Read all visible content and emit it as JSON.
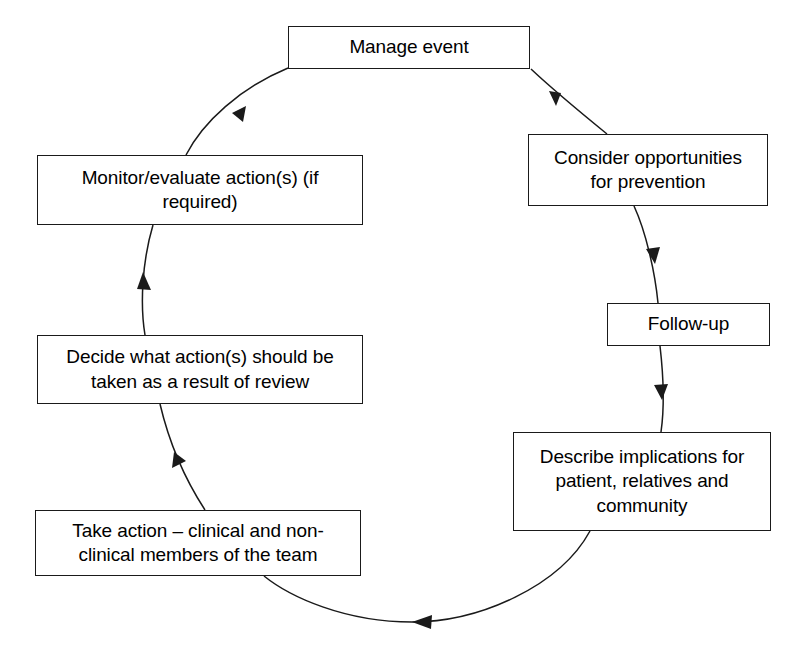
{
  "diagram": {
    "type": "cycle-flow",
    "direction": "counter-clockwise",
    "stroke_color": "#1a1a1a",
    "background_color": "#ffffff",
    "nodes": [
      {
        "id": "manage-event",
        "label": "Manage event"
      },
      {
        "id": "consider",
        "label": "Consider opportunities\nfor prevention"
      },
      {
        "id": "follow-up",
        "label": "Follow-up"
      },
      {
        "id": "describe",
        "label": "Describe implications for\npatient, relatives and\ncommunity"
      },
      {
        "id": "take-action",
        "label": "Take action – clinical and non-\nclinical members of the team"
      },
      {
        "id": "decide",
        "label": "Decide what action(s) should be\ntaken as a result of review"
      },
      {
        "id": "monitor",
        "label": "Monitor/evaluate action(s) (if\nrequired)"
      }
    ],
    "connectors": [
      {
        "id": "manage-to-consider",
        "from": "manage-event",
        "to": "consider",
        "arrow": "down-right"
      },
      {
        "id": "consider-to-followup",
        "from": "consider",
        "to": "follow-up",
        "arrow": "down"
      },
      {
        "id": "followup-to-describe",
        "from": "follow-up",
        "to": "describe",
        "arrow": "down"
      },
      {
        "id": "describe-to-takeaction",
        "from": "describe",
        "to": "take-action",
        "arrow": "left"
      },
      {
        "id": "takeaction-to-decide",
        "from": "take-action",
        "to": "decide",
        "arrow": "up-left"
      },
      {
        "id": "decide-to-monitor",
        "from": "decide",
        "to": "monitor",
        "arrow": "up"
      },
      {
        "id": "monitor-to-manage",
        "from": "monitor",
        "to": "manage-event",
        "arrow": "up-right"
      }
    ]
  }
}
